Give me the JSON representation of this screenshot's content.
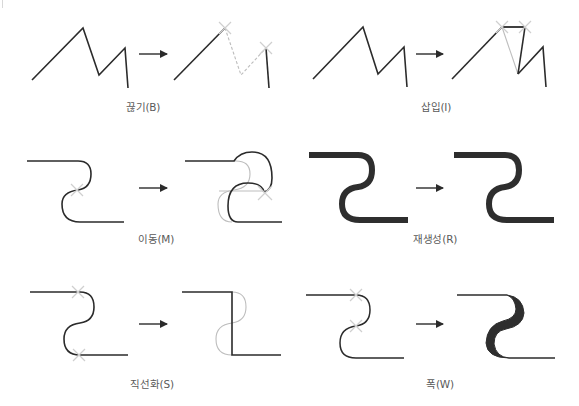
{
  "colors": {
    "stroke": "#2b2b2b",
    "ghost": "#b8b8b8",
    "marker": "#cfcfcf",
    "label": "#5a5a5a"
  },
  "panels": [
    {
      "id": "break",
      "label": "끊기(B)",
      "description": "Break path at anchor points"
    },
    {
      "id": "insert",
      "label": "삽입(I)",
      "description": "Insert segment between anchor points"
    },
    {
      "id": "move",
      "label": "이동(M)",
      "description": "Move anchor point"
    },
    {
      "id": "regenerate",
      "label": "재생성(R)",
      "description": "Regenerate stroke"
    },
    {
      "id": "straighten",
      "label": "직선화(S)",
      "description": "Straighten segment between anchors"
    },
    {
      "id": "width",
      "label": "폭(W)",
      "description": "Change stroke width between anchors"
    }
  ],
  "icons": {
    "arrow": "right-arrow-icon",
    "marker": "x-marker-icon"
  }
}
